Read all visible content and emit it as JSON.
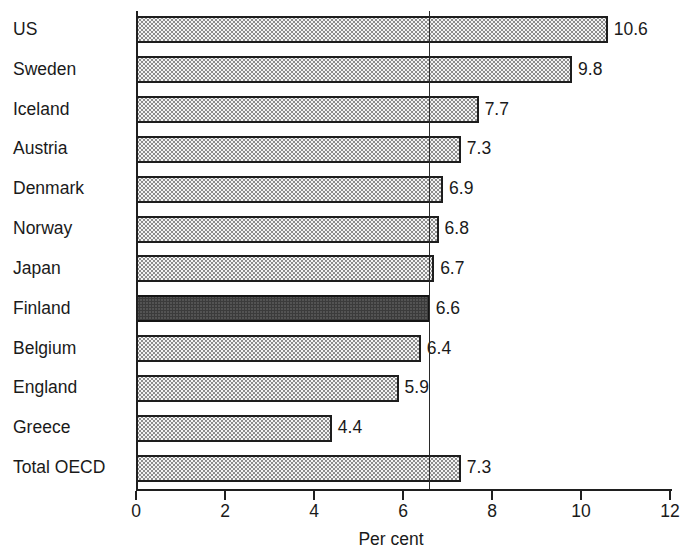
{
  "chart_data": {
    "type": "bar",
    "orientation": "horizontal",
    "title": "",
    "subtitle": "",
    "xlabel": "Per cent",
    "ylabel": "",
    "xlim": [
      0,
      12
    ],
    "xticks": [
      0,
      2,
      4,
      6,
      8,
      10,
      12
    ],
    "xtick_labels": [
      "0",
      "2",
      "4",
      "6",
      "8",
      "10",
      "12"
    ],
    "grid": false,
    "legend": null,
    "categories": [
      "US",
      "Sweden",
      "Iceland",
      "Austria",
      "Denmark",
      "Norway",
      "Japan",
      "Finland",
      "Belgium",
      "England",
      "Greece",
      "Total OECD"
    ],
    "values": [
      10.6,
      9.8,
      7.7,
      7.3,
      6.9,
      6.8,
      6.7,
      6.6,
      6.4,
      5.9,
      4.4,
      7.3
    ],
    "data_labels": [
      "10.6",
      "9.8",
      "7.7",
      "7.3",
      "6.9",
      "6.8",
      "6.7",
      "6.6",
      "6.4",
      "5.9",
      "4.4",
      "7.3"
    ],
    "highlight_category": "Finland",
    "annotations": [
      {
        "kind": "vertical-reference-line",
        "value": 6.6,
        "label": ""
      }
    ],
    "colors": {
      "bar_fill": "#f4f4f4",
      "bar_stipple": "#8d8d8d",
      "bar_edge": "#1d1d1d",
      "highlight_fill": "#9a9a9a",
      "highlight_stipple": "#3b3b3b",
      "axis": "#1f1f1f",
      "text": "#1a1a1a",
      "reference_line": "#2a2a2a"
    }
  }
}
